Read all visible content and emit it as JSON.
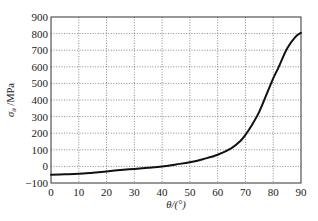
{
  "chart_data": {
    "type": "line",
    "title": "",
    "xlabel": "θ/(°)",
    "ylabel": "σθ /MPa",
    "ylabel_symbol": "σ",
    "ylabel_subscript": "θ",
    "ylabel_unit": " /MPa",
    "xlim": [
      0,
      90
    ],
    "ylim": [
      -100,
      900
    ],
    "xticks": [
      0,
      10,
      20,
      30,
      40,
      50,
      60,
      70,
      80,
      90
    ],
    "yticks": [
      -100,
      0,
      100,
      200,
      300,
      400,
      500,
      600,
      700,
      800,
      900
    ],
    "xtick_labels": [
      "0",
      "10",
      "20",
      "30",
      "40",
      "50",
      "60",
      "70",
      "80",
      "90"
    ],
    "ytick_labels": [
      "-100",
      "0",
      "100",
      "200",
      "300",
      "400",
      "500",
      "600",
      "700",
      "800",
      "900"
    ],
    "grid": true,
    "legend": null,
    "series": [
      {
        "name": "σθ",
        "color": "#111111",
        "x": [
          0,
          5,
          10,
          15,
          20,
          25,
          30,
          35,
          40,
          45,
          50,
          55,
          60,
          65,
          68,
          70,
          72,
          75,
          78,
          80,
          82,
          85,
          88,
          90
        ],
        "y": [
          -50,
          -48,
          -45,
          -38,
          -30,
          -22,
          -15,
          -8,
          0,
          12,
          25,
          45,
          70,
          110,
          150,
          190,
          240,
          330,
          450,
          530,
          600,
          710,
          780,
          805
        ]
      }
    ]
  }
}
